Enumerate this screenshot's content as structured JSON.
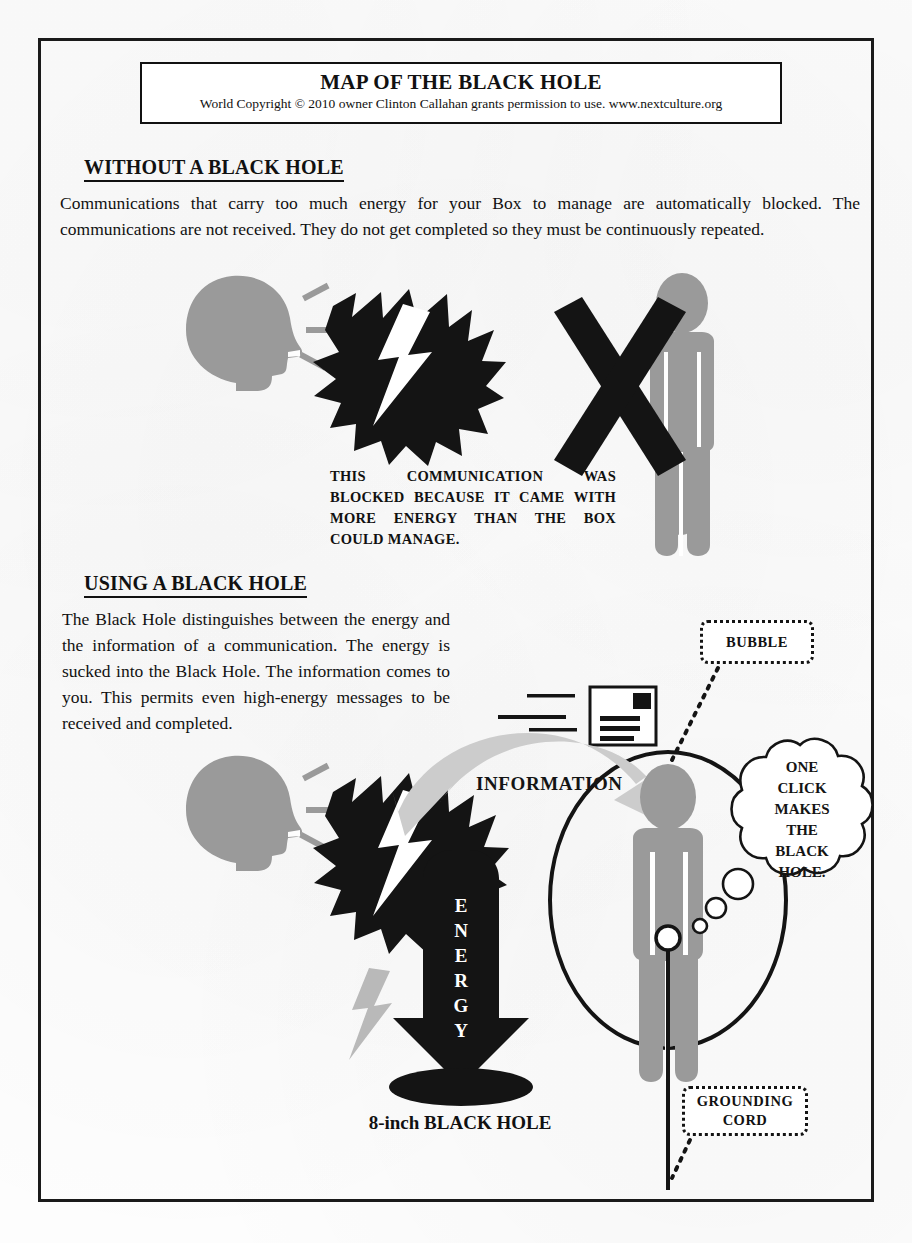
{
  "document": {
    "title": "MAP OF THE BLACK HOLE",
    "copyright": "World Copyright © 2010 owner Clinton Callahan grants permission to use. www.nextculture.org"
  },
  "sections": {
    "without": {
      "heading": "WITHOUT A BLACK HOLE",
      "body": "Communications that carry too much energy for your Box to manage are automatically blocked. The communications are not received. They do not get completed so they must be continuously repeated.",
      "caption": "THIS COMMUNICATION WAS BLOCKED BECAUSE IT CAME WITH MORE ENERGY THAN THE BOX COULD MANAGE."
    },
    "using": {
      "heading": "USING A BLACK HOLE",
      "body": "The Black Hole distinguishes between the energy and the information of a communication. The energy is sucked into the Black Hole. The information comes to you. This permits even high-energy messages to be received and completed.",
      "caption": "8-inch BLACK HOLE"
    }
  },
  "labels": {
    "bubble": "BUBBLE",
    "grounding_cord_line1": "GROUNDING",
    "grounding_cord_line2": "CORD",
    "information": "INFORMATION",
    "energy": "ENERGY",
    "energy_letters": [
      "E",
      "N",
      "E",
      "R",
      "G",
      "Y"
    ],
    "thought": [
      "ONE",
      "CLICK",
      "MAKES",
      "THE",
      "BLACK",
      "HOLE."
    ]
  },
  "colors": {
    "ink": "#141414",
    "figure_gray": "#9a9a9a",
    "arrow_gray": "#c9c9c9",
    "paper": "#fdfdfd"
  }
}
